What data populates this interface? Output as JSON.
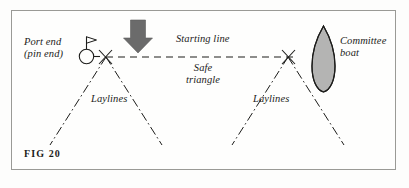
{
  "figure": {
    "caption": "FIG 20",
    "frame_color": "#9a9a96",
    "background_color": "#fefefd",
    "ink_color": "#1c1c1a",
    "arrow_color": "#6b6b6b",
    "boat_fill_color": "#e8e8e6"
  },
  "labels": {
    "port_end_line1": "Port end",
    "port_end_line2": "(pin end)",
    "starting_line": "Starting line",
    "safe_line1": "Safe",
    "safe_line2": "triangle",
    "committee_line1": "Committee",
    "committee_line2": "boat",
    "laylines_left": "Laylines",
    "laylines_right": "Laylines"
  },
  "elements": {
    "wind_arrow": "down-arrow-icon",
    "pin_buoy": "buoy-flag-icon",
    "committee_boat": "boat-hull-icon",
    "start_line_style": "dashed",
    "layline_style": "dash-dot"
  }
}
